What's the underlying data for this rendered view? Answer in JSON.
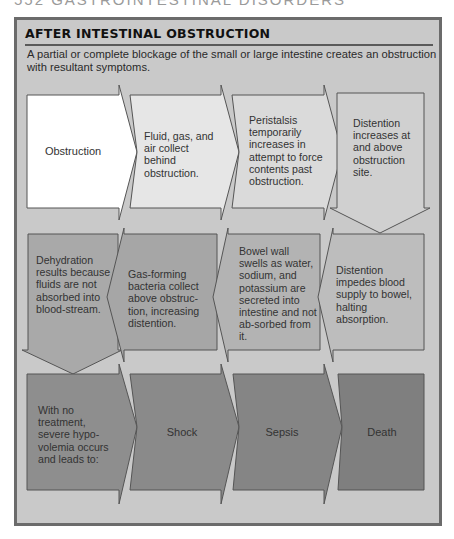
{
  "page_header": "552 GASTROINTESTINAL DISORDERS",
  "panel": {
    "title": "AFTER INTESTINAL OBSTRUCTION",
    "intro": "A partial or complete blockage of the small or large intestine creates an obstruction with resultant symptoms."
  },
  "flow": {
    "row1": [
      {
        "text": "Obstruction",
        "arrow": "right",
        "fill": "#ffffff"
      },
      {
        "text": "Fluid, gas, and air collect behind obstruction.",
        "arrow": "right",
        "fill": "#e6e6e6"
      },
      {
        "text": "Peristalsis temporarily increases in attempt to force contents past obstruction.",
        "arrow": "right",
        "fill": "#dadada"
      },
      {
        "text": "Distention increases at and above obstruction site.",
        "arrow": "down",
        "fill": "#d0d0d0"
      }
    ],
    "row2": [
      {
        "text": "Dehydration results because fluids are not absorbed into blood-stream.",
        "arrow": "down",
        "fill": "#a9a9a9"
      },
      {
        "text": "Gas-forming bacteria collect above obstruc-tion, increasing distention.",
        "arrow": "left",
        "fill": "#a6a6a6"
      },
      {
        "text": "Bowel wall swells as water, sodium, and potassium are secreted into intestine and not ab-sorbed from it.",
        "arrow": "left",
        "fill": "#b3b3b3"
      },
      {
        "text": "Distention impedes blood supply to bowel, halting absorption.",
        "arrow": "left",
        "fill": "#bdbdbd"
      }
    ],
    "row3": [
      {
        "text": "With no treatment, severe hypo-volemia occurs and leads to:",
        "arrow": "right",
        "fill": "#8e8e8e"
      },
      {
        "text": "Shock",
        "arrow": "right",
        "fill": "#8a8a8a"
      },
      {
        "text": "Sepsis",
        "arrow": "right",
        "fill": "#858585"
      },
      {
        "text": "Death",
        "arrow": "none",
        "fill": "#7f7f7f"
      }
    ]
  },
  "colors": {
    "panel_bg": "#c9c9c9",
    "panel_border": "#6b6b6b",
    "shape_stroke": "#555555"
  }
}
